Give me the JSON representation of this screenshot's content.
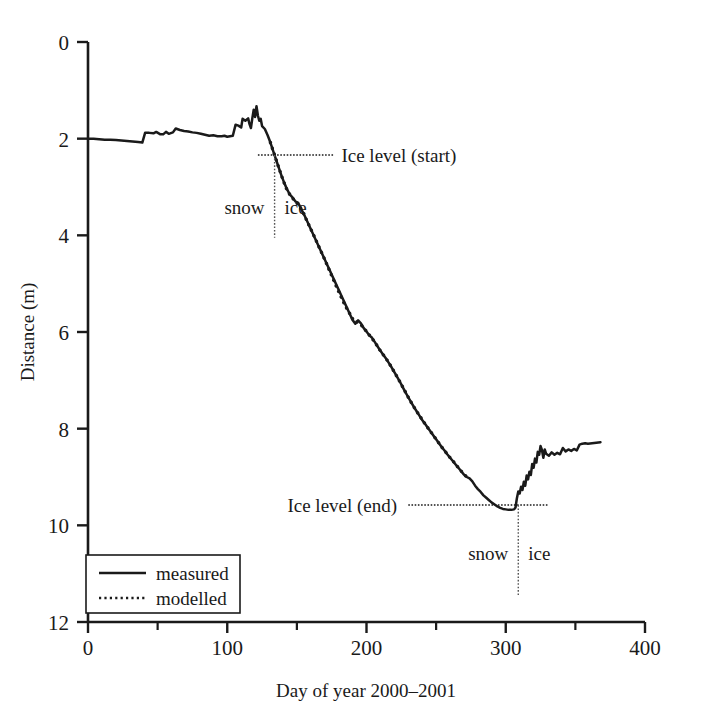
{
  "chart_data": {
    "type": "line",
    "title": "",
    "xlabel": "Day of year 2000–2001",
    "ylabel": "Distance (m)",
    "xlim": [
      0,
      400
    ],
    "ylim": [
      12,
      0
    ],
    "y_inverted": true,
    "grid": false,
    "xticks": [
      0,
      100,
      200,
      300,
      400
    ],
    "xtick_labels": [
      "0",
      "100",
      "200",
      "300",
      "400"
    ],
    "x_minor_ticks": [
      50,
      150,
      250,
      350
    ],
    "yticks": [
      0,
      2,
      4,
      6,
      8,
      10,
      12
    ],
    "ytick_labels": [
      "0",
      "2",
      "4",
      "6",
      "8",
      "10",
      "12"
    ],
    "legend_position": "lower left",
    "series": [
      {
        "name": "measured",
        "style": "solid",
        "color": "#1a1a1a",
        "points": [
          [
            0,
            2.0
          ],
          [
            4,
            2.0
          ],
          [
            8,
            2.01
          ],
          [
            12,
            2.02
          ],
          [
            16,
            2.02
          ],
          [
            20,
            2.03
          ],
          [
            24,
            2.04
          ],
          [
            28,
            2.05
          ],
          [
            32,
            2.06
          ],
          [
            36,
            2.07
          ],
          [
            39,
            2.08
          ],
          [
            41,
            1.88
          ],
          [
            44,
            1.88
          ],
          [
            47,
            1.89
          ],
          [
            49,
            1.86
          ],
          [
            52,
            1.91
          ],
          [
            54,
            1.91
          ],
          [
            56,
            1.86
          ],
          [
            58,
            1.9
          ],
          [
            61,
            1.87
          ],
          [
            63,
            1.79
          ],
          [
            66,
            1.82
          ],
          [
            69,
            1.84
          ],
          [
            72,
            1.85
          ],
          [
            75,
            1.87
          ],
          [
            78,
            1.88
          ],
          [
            81,
            1.9
          ],
          [
            84,
            1.92
          ],
          [
            87,
            1.94
          ],
          [
            90,
            1.93
          ],
          [
            93,
            1.95
          ],
          [
            96,
            1.95
          ],
          [
            98,
            1.94
          ],
          [
            100,
            1.96
          ],
          [
            102,
            1.95
          ],
          [
            104,
            1.94
          ],
          [
            106,
            1.71
          ],
          [
            108,
            1.73
          ],
          [
            110,
            1.77
          ],
          [
            111,
            1.59
          ],
          [
            113,
            1.63
          ],
          [
            115,
            1.58
          ],
          [
            116,
            1.7
          ],
          [
            117,
            1.78
          ],
          [
            118,
            1.58
          ],
          [
            119,
            1.4
          ],
          [
            120,
            1.55
          ],
          [
            121,
            1.33
          ],
          [
            122,
            1.52
          ],
          [
            123,
            1.63
          ],
          [
            124,
            1.59
          ],
          [
            125,
            1.74
          ],
          [
            127,
            1.8
          ],
          [
            129,
            1.93
          ],
          [
            131,
            2.08
          ],
          [
            133,
            2.26
          ],
          [
            135,
            2.43
          ],
          [
            137,
            2.6
          ],
          [
            139,
            2.77
          ],
          [
            141,
            2.92
          ],
          [
            143,
            3.05
          ],
          [
            145,
            3.16
          ],
          [
            147,
            3.22
          ],
          [
            149,
            3.3
          ],
          [
            151,
            3.33
          ],
          [
            153,
            3.45
          ],
          [
            155,
            3.56
          ],
          [
            190,
            5.75
          ],
          [
            192,
            5.83
          ],
          [
            194,
            5.76
          ],
          [
            196,
            5.82
          ],
          [
            198,
            5.92
          ],
          [
            200,
            5.99
          ],
          [
            202,
            6.07
          ],
          [
            204,
            6.12
          ],
          [
            206,
            6.21
          ],
          [
            208,
            6.3
          ],
          [
            210,
            6.39
          ],
          [
            212,
            6.47
          ],
          [
            214,
            6.55
          ],
          [
            216,
            6.64
          ],
          [
            218,
            6.73
          ],
          [
            220,
            6.83
          ],
          [
            222,
            6.93
          ],
          [
            224,
            7.03
          ],
          [
            226,
            7.14
          ],
          [
            228,
            7.25
          ],
          [
            230,
            7.35
          ],
          [
            232,
            7.45
          ],
          [
            234,
            7.55
          ],
          [
            236,
            7.64
          ],
          [
            238,
            7.73
          ],
          [
            240,
            7.82
          ],
          [
            242,
            7.9
          ],
          [
            244,
            7.98
          ],
          [
            246,
            8.06
          ],
          [
            248,
            8.14
          ],
          [
            250,
            8.22
          ],
          [
            252,
            8.3
          ],
          [
            254,
            8.38
          ],
          [
            256,
            8.45
          ],
          [
            258,
            8.53
          ],
          [
            260,
            8.6
          ],
          [
            262,
            8.67
          ],
          [
            264,
            8.74
          ],
          [
            266,
            8.81
          ],
          [
            268,
            8.88
          ],
          [
            270,
            8.95
          ],
          [
            272,
            9.0
          ],
          [
            274,
            9.03
          ],
          [
            276,
            9.09
          ],
          [
            278,
            9.18
          ],
          [
            280,
            9.25
          ],
          [
            282,
            9.31
          ],
          [
            284,
            9.38
          ],
          [
            286,
            9.43
          ],
          [
            288,
            9.48
          ],
          [
            290,
            9.53
          ],
          [
            292,
            9.57
          ],
          [
            294,
            9.61
          ],
          [
            296,
            9.64
          ],
          [
            298,
            9.66
          ],
          [
            300,
            9.67
          ],
          [
            302,
            9.68
          ],
          [
            304,
            9.68
          ],
          [
            306,
            9.67
          ],
          [
            307,
            9.63
          ],
          [
            308,
            9.44
          ],
          [
            309,
            9.3
          ],
          [
            310,
            9.34
          ],
          [
            311,
            9.2
          ],
          [
            312,
            9.27
          ],
          [
            313,
            9.1
          ],
          [
            314,
            9.18
          ],
          [
            315,
            8.97
          ],
          [
            316,
            9.05
          ],
          [
            317,
            8.89
          ],
          [
            318,
            8.96
          ],
          [
            319,
            8.73
          ],
          [
            320,
            8.81
          ],
          [
            321,
            8.62
          ],
          [
            322,
            8.7
          ],
          [
            323,
            8.48
          ],
          [
            324,
            8.54
          ],
          [
            325,
            8.36
          ],
          [
            326,
            8.44
          ],
          [
            327,
            8.6
          ],
          [
            328,
            8.43
          ],
          [
            329,
            8.52
          ],
          [
            331,
            8.56
          ],
          [
            333,
            8.49
          ],
          [
            335,
            8.54
          ],
          [
            337,
            8.5
          ],
          [
            339,
            8.53
          ],
          [
            341,
            8.4
          ],
          [
            343,
            8.47
          ],
          [
            345,
            8.43
          ],
          [
            347,
            8.46
          ],
          [
            349,
            8.42
          ],
          [
            351,
            8.45
          ],
          [
            353,
            8.33
          ],
          [
            355,
            8.31
          ],
          [
            357,
            8.3
          ],
          [
            359,
            8.31
          ],
          [
            362,
            8.3
          ],
          [
            365,
            8.29
          ],
          [
            368,
            8.28
          ]
        ]
      },
      {
        "name": "modelled",
        "style": "dotted",
        "color": "#1a1a1a",
        "points": [
          [
            131,
            2.08
          ],
          [
            134,
            2.34
          ],
          [
            137,
            2.6
          ],
          [
            140,
            2.85
          ],
          [
            143,
            3.07
          ],
          [
            146,
            3.2
          ],
          [
            149,
            3.3
          ],
          [
            152,
            3.4
          ],
          [
            155,
            3.56
          ],
          [
            158,
            3.75
          ],
          [
            161,
            3.93
          ],
          [
            164,
            4.12
          ],
          [
            167,
            4.31
          ],
          [
            170,
            4.5
          ],
          [
            173,
            4.7
          ],
          [
            176,
            4.9
          ],
          [
            179,
            5.1
          ],
          [
            182,
            5.29
          ],
          [
            185,
            5.47
          ],
          [
            188,
            5.62
          ],
          [
            191,
            5.78
          ],
          [
            194,
            5.8
          ],
          [
            197,
            5.88
          ],
          [
            200,
            5.99
          ],
          [
            203,
            6.1
          ],
          [
            206,
            6.21
          ],
          [
            209,
            6.35
          ],
          [
            212,
            6.47
          ],
          [
            215,
            6.59
          ],
          [
            218,
            6.73
          ],
          [
            221,
            6.88
          ],
          [
            224,
            7.03
          ],
          [
            227,
            7.19
          ],
          [
            230,
            7.35
          ],
          [
            233,
            7.5
          ],
          [
            236,
            7.64
          ],
          [
            239,
            7.77
          ],
          [
            242,
            7.9
          ],
          [
            245,
            8.02
          ],
          [
            248,
            8.14
          ],
          [
            251,
            8.26
          ],
          [
            254,
            8.38
          ],
          [
            257,
            8.49
          ],
          [
            260,
            8.6
          ],
          [
            263,
            8.7
          ],
          [
            266,
            8.81
          ],
          [
            269,
            8.91
          ],
          [
            272,
            9.0
          ]
        ]
      }
    ],
    "annotations": [
      {
        "name": "ice-level-start",
        "text": "Ice level (start)",
        "y_value": 2.34,
        "line_x_range": [
          122,
          176
        ],
        "text_x": 182,
        "text_anchor": "start"
      },
      {
        "name": "ice-level-end",
        "text": "Ice level (end)",
        "y_value": 9.58,
        "line_x_range": [
          230,
          330
        ],
        "text_x": 222,
        "text_anchor": "end"
      },
      {
        "name": "snow-ice-divider-start",
        "x_value": 134,
        "y_range": [
          2.34,
          4.05
        ],
        "left_text": "snow",
        "right_text": "ice",
        "text_y": 3.55
      },
      {
        "name": "snow-ice-divider-end",
        "x_value": 309,
        "y_range": [
          9.58,
          11.45
        ],
        "left_text": "snow",
        "right_text": "ice",
        "text_y": 10.72
      }
    ]
  },
  "legend": {
    "items": [
      {
        "label": "measured",
        "style": "solid"
      },
      {
        "label": "modelled",
        "style": "dotted"
      }
    ]
  },
  "axes": {
    "x_title": "Day of year 2000–2001",
    "y_title": "Distance (m)"
  }
}
